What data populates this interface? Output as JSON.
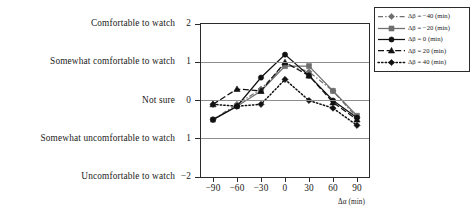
{
  "chart_data": {
    "type": "line",
    "title": "",
    "xlabel": "Δα (min)",
    "ylabel": "",
    "x": [
      -90,
      -60,
      -30,
      0,
      30,
      60,
      90
    ],
    "xtick_labels": [
      "−90",
      "−60",
      "−30",
      "0",
      "30",
      "60",
      "90"
    ],
    "xlim": [
      -105,
      105
    ],
    "ylim": [
      -2,
      2
    ],
    "ytick_values": [
      2,
      1,
      0,
      -1,
      -2
    ],
    "ytick_labels": [
      "2",
      "1",
      "0",
      "1",
      "−2"
    ],
    "ytick_text": [
      "Comfortable to watch",
      "Somewhat comfortable to watch",
      "Not sure",
      "Somewhat uncomfortable to watch",
      "Uncomfortable to watch"
    ],
    "grid": true,
    "legend_position": "upper right",
    "series": [
      {
        "name": "Δβ = −40 (min)",
        "marker": "diamond",
        "color": "#6e6e6e",
        "linestyle": "dash-dot",
        "values": [
          -0.5,
          -0.1,
          0.3,
          0.95,
          0.75,
          0.25,
          -0.45
        ]
      },
      {
        "name": "Δβ = −20 (min)",
        "marker": "square",
        "color": "#6e6e6e",
        "linestyle": "solid",
        "values": [
          -0.5,
          -0.15,
          0.25,
          0.9,
          0.9,
          0.25,
          -0.4
        ]
      },
      {
        "name": "Δβ = 0 (min)",
        "marker": "circle",
        "color": "#111111",
        "linestyle": "solid",
        "values": [
          -0.5,
          -0.15,
          0.6,
          1.2,
          0.65,
          0.0,
          -0.45
        ]
      },
      {
        "name": "Δβ = 20 (min)",
        "marker": "triangle",
        "color": "#111111",
        "linestyle": "dashed",
        "values": [
          -0.1,
          0.3,
          0.25,
          1.0,
          0.65,
          -0.05,
          -0.5
        ]
      },
      {
        "name": "Δβ = 40 (min)",
        "marker": "diamond",
        "color": "#111111",
        "linestyle": "dotted",
        "values": [
          -0.1,
          -0.15,
          -0.1,
          0.55,
          0.0,
          -0.2,
          -0.65
        ]
      }
    ]
  },
  "axis": {
    "x_title": "Δα (min)"
  }
}
